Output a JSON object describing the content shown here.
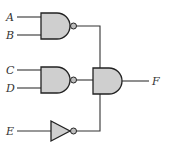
{
  "diagram": {
    "type": "logic-circuit",
    "inputs": [
      {
        "id": "A",
        "label": "A"
      },
      {
        "id": "B",
        "label": "B"
      },
      {
        "id": "C",
        "label": "C"
      },
      {
        "id": "D",
        "label": "D"
      },
      {
        "id": "E",
        "label": "E"
      }
    ],
    "gates": [
      {
        "id": "g1",
        "type": "NAND",
        "inputs": [
          "A",
          "B"
        ]
      },
      {
        "id": "g2",
        "type": "NAND",
        "inputs": [
          "C",
          "D"
        ]
      },
      {
        "id": "g3",
        "type": "NOT",
        "inputs": [
          "E"
        ]
      },
      {
        "id": "g4",
        "type": "AND",
        "inputs": [
          "g1",
          "g2",
          "g3"
        ]
      }
    ],
    "output": {
      "id": "F",
      "label": "F",
      "from": "g4"
    },
    "colors": {
      "gate_fill": "#cfcfcf",
      "stroke": "#222222",
      "wire": "#333333"
    }
  }
}
